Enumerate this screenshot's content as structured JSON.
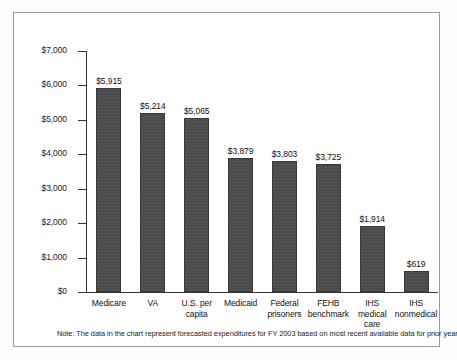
{
  "chart_data": {
    "type": "bar",
    "title": "",
    "subtitle": "",
    "xlabel": "",
    "ylabel": "",
    "ylim": [
      0,
      7000
    ],
    "grid": false,
    "legend": "none",
    "orientation": "vertical",
    "bar_color": "#4b4b4b",
    "categories": [
      "Medicare",
      "VA",
      "U.S. per capita",
      "Medicaid",
      "Federal prisoners",
      "FEHB benchmark",
      "IHS medical care",
      "IHS nonmedical"
    ],
    "category_lines": [
      [
        "Medicare"
      ],
      [
        "VA"
      ],
      [
        "U.S. per",
        "capita"
      ],
      [
        "Medicaid"
      ],
      [
        "Federal",
        "prisoners"
      ],
      [
        "FEHB",
        "benchmark"
      ],
      [
        "IHS",
        "medical",
        "care"
      ],
      [
        "IHS",
        "nonmedical"
      ]
    ],
    "values": [
      5915,
      5214,
      5065,
      3879,
      3803,
      3725,
      1914,
      619
    ],
    "value_labels": [
      "$5,915",
      "$5,214",
      "$5,065",
      "$3,879",
      "$3,803",
      "$3,725",
      "$1,914",
      "$619"
    ],
    "yticks": [
      0,
      1000,
      2000,
      3000,
      4000,
      5000,
      6000,
      7000
    ],
    "ytick_labels": [
      "$0",
      "$1,000",
      "$2,000",
      "$3,000",
      "$4,000",
      "$5,000",
      "$6,000",
      "$7,000"
    ]
  },
  "footnote": {
    "text": "Note:  The data in the chart represent forecasted expenditures for FY 2003 based on most recent available data for prior years."
  }
}
